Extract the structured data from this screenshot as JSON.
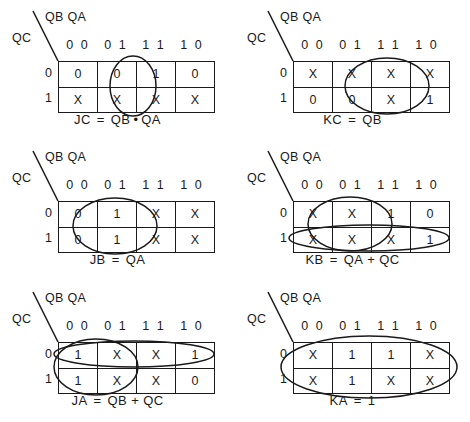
{
  "sheet": {
    "title": "Karnaugh maps for JK flip-flop excitation equations",
    "axis_labels": {
      "top": "QB QA",
      "side": "QC"
    },
    "column_headers": [
      "0 0",
      "0 1",
      "1 1",
      "1 0"
    ],
    "row_headers": [
      "0",
      "1"
    ]
  },
  "maps": [
    {
      "id": "jc",
      "name": "JC",
      "cells": [
        [
          "0",
          "0",
          "1",
          "0"
        ],
        [
          "X",
          "X",
          "X",
          "X"
        ]
      ],
      "equation": {
        "lhs": "JC",
        "eq": "=",
        "terms": [
          {
            "text": "QB",
            "overbar": false
          },
          {
            "text": "QA",
            "overbar": false
          }
        ],
        "operator": "•",
        "plain": "JC = QB • QA"
      },
      "groups": [
        {
          "label": "col-11-both-rows",
          "cx": 97,
          "cy": 39,
          "rx": 23,
          "ry": 30
        }
      ]
    },
    {
      "id": "kc",
      "name": "KC",
      "cells": [
        [
          "X",
          "X",
          "X",
          "X"
        ],
        [
          "0",
          "0",
          "X",
          "1"
        ]
      ],
      "equation": {
        "lhs": "KC",
        "eq": "=",
        "terms": [
          {
            "text": "QB",
            "overbar": false
          }
        ],
        "operator": "",
        "plain": "KC = QB"
      },
      "groups": [
        {
          "label": "cols-11-10-both-rows",
          "cx": 116,
          "cy": 39,
          "rx": 42,
          "ry": 28
        }
      ]
    },
    {
      "id": "jb",
      "name": "JB",
      "cells": [
        [
          "0",
          "1",
          "X",
          "X"
        ],
        [
          "0",
          "1",
          "X",
          "X"
        ]
      ],
      "equation": {
        "lhs": "JB",
        "eq": "=",
        "terms": [
          {
            "text": "QA",
            "overbar": false
          }
        ],
        "operator": "",
        "plain": "JB = QA"
      },
      "groups": [
        {
          "label": "cols-01-11-both-rows",
          "cx": 79,
          "cy": 39,
          "rx": 42,
          "ry": 28
        }
      ]
    },
    {
      "id": "kb",
      "name": "KB",
      "cells": [
        [
          "X",
          "X",
          "1",
          "0"
        ],
        [
          "X",
          "X",
          "X",
          "1"
        ]
      ],
      "equation": {
        "lhs": "KB",
        "eq": "=",
        "terms": [
          {
            "text": "QA",
            "overbar": false
          },
          {
            "text": "QC",
            "overbar": false
          }
        ],
        "operator": "+",
        "plain": "KB = QA + QC"
      },
      "groups": [
        {
          "label": "cols-01-11-both-rows",
          "cx": 79,
          "cy": 37,
          "rx": 42,
          "ry": 27
        },
        {
          "label": "bottom-row-all-cols",
          "cx": 98,
          "cy": 51,
          "rx": 80,
          "ry": 13
        }
      ]
    },
    {
      "id": "ja",
      "name": "JA",
      "cells": [
        [
          "1",
          "X",
          "X",
          "1"
        ],
        [
          "1",
          "X",
          "X",
          "0"
        ]
      ],
      "equation": {
        "lhs": "JA",
        "eq": "=",
        "terms": [
          {
            "text": "QB",
            "overbar": true
          },
          {
            "text": "QC",
            "overbar": true
          }
        ],
        "operator": "+",
        "plain": "JA = QB' + QC'"
      },
      "groups": [
        {
          "label": "top-row-all-cols",
          "cx": 98,
          "cy": 26,
          "rx": 80,
          "ry": 13
        },
        {
          "label": "cols-00-01-both-rows",
          "cx": 60,
          "cy": 39,
          "rx": 42,
          "ry": 28
        }
      ]
    },
    {
      "id": "ka",
      "name": "KA",
      "cells": [
        [
          "X",
          "1",
          "1",
          "X"
        ],
        [
          "X",
          "1",
          "X",
          "X"
        ]
      ],
      "equation": {
        "lhs": "KA",
        "eq": "=",
        "terms": [
          {
            "text": "1",
            "overbar": false
          }
        ],
        "operator": "",
        "plain": "KA = 1"
      },
      "groups": [
        {
          "label": "all-cells",
          "cx": 98,
          "cy": 39,
          "rx": 88,
          "ry": 31
        }
      ]
    }
  ],
  "colors": {
    "ink": "#1a1a1a",
    "paper": "#ffffff"
  }
}
